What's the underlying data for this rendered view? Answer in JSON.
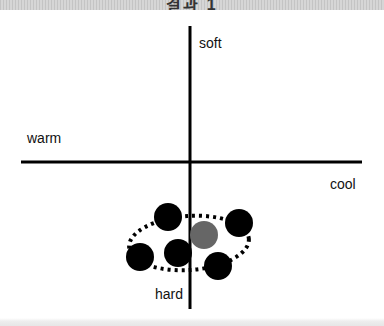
{
  "header": {
    "title": "결과 1"
  },
  "axes": {
    "top_label": "soft",
    "bottom_label": "hard",
    "left_label": "warm",
    "right_label": "cool"
  },
  "colors": {
    "axis": "#000000",
    "dot": "#000000",
    "highlight_dot": "#666666",
    "ellipse": "#000000"
  },
  "points": [
    {
      "id": "dot-1",
      "cx": 168,
      "cy": 217,
      "type": "black"
    },
    {
      "id": "dot-2",
      "cx": 239,
      "cy": 223,
      "type": "black"
    },
    {
      "id": "dot-3",
      "cx": 140,
      "cy": 257,
      "type": "black"
    },
    {
      "id": "dot-4",
      "cx": 178,
      "cy": 253,
      "type": "black"
    },
    {
      "id": "dot-5",
      "cx": 218,
      "cy": 266,
      "type": "black"
    },
    {
      "id": "dot-highlight",
      "cx": 204,
      "cy": 235,
      "type": "gray"
    }
  ]
}
